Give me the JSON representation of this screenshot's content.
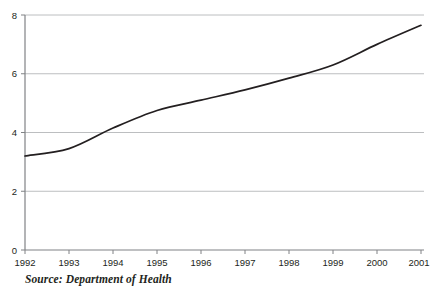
{
  "source_note": "Source: Department of Health",
  "colors": {
    "line": "#231f20",
    "axis": "#808285",
    "grid": "#bcbec0",
    "text": "#231f20",
    "background": "#ffffff"
  },
  "chart_data": {
    "type": "line",
    "title": "",
    "subtitle": "",
    "xlabel": "",
    "ylabel": "",
    "x": [
      1992,
      1993,
      1994,
      1995,
      1996,
      1997,
      1998,
      1999,
      2000,
      2001
    ],
    "categories": [
      "1992",
      "1993",
      "1994",
      "1995",
      "1996",
      "1997",
      "1998",
      "1999",
      "2000",
      "2001"
    ],
    "values": [
      3.2,
      3.45,
      4.15,
      4.75,
      5.1,
      5.45,
      5.85,
      6.3,
      7.0,
      7.65
    ],
    "series": [
      {
        "name": "",
        "values": [
          3.2,
          3.45,
          4.15,
          4.75,
          5.1,
          5.45,
          5.85,
          6.3,
          7.0,
          7.65
        ]
      }
    ],
    "xlim": [
      1992,
      2001
    ],
    "ylim": [
      0,
      8
    ],
    "ytick_labels": [
      "0",
      "2",
      "4",
      "6",
      "8"
    ],
    "yticks": [
      0,
      2,
      4,
      6,
      8
    ],
    "xtick_labels": [
      "1992",
      "1993",
      "1994",
      "1995",
      "1996",
      "1997",
      "1998",
      "1999",
      "2000",
      "2001"
    ],
    "grid": true,
    "grid_axis": "y",
    "legend": false,
    "legend_position": "none",
    "annotations": []
  }
}
